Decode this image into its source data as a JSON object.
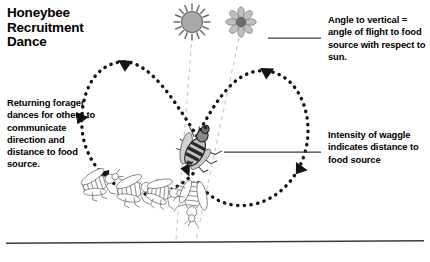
{
  "figure": {
    "title": "Honeybee\nRecruitment\nDance",
    "background_color": "#ffffff",
    "ink_color": "#000000",
    "rule_color": "#3c3c3c"
  },
  "captions": {
    "returning_forager": "Returning forager dances for others to communicate direction and distance to food source.",
    "angle_to_vertical": "Angle to vertical = angle of flight to food source with respect to sun.",
    "intensity_of_waggle": "Intensity of waggle indicates distance to food source"
  },
  "diagram": {
    "sun": {
      "name": "sun",
      "fill": "#a8a8a8",
      "stroke": "#6e6e6e",
      "cx": 192,
      "cy": 22,
      "r": 11
    },
    "flower": {
      "name": "flower",
      "petal_fill": "#bdbdbd",
      "center_fill": "#6b6b6b",
      "cx": 241,
      "cy": 22,
      "r": 12
    },
    "dance_path": {
      "name": "waggle-dance-figure-eight",
      "style": "dashed",
      "dash_color": "#141414",
      "arrow_count": 5,
      "description": "Figure-eight waggle dance loop traced by the returning forager"
    },
    "reference_lines": [
      {
        "name": "vertical-reference-from-sun",
        "color": "#c4c4c4",
        "style": "dashed"
      },
      {
        "name": "flight-angle-reference-from-flower",
        "color": "#c4c4c4",
        "style": "dashed"
      }
    ],
    "bees": {
      "dancer": {
        "name": "dancing-forager-bee",
        "body_fill": "#8e8e8e",
        "outline": "#2b2b2b"
      },
      "followers_count": 4,
      "followers_outline": "#7a7a7a"
    },
    "leader_lines": [
      {
        "name": "leader-line-angle",
        "x1": 268,
        "y1": 38,
        "x2": 321,
        "y2": 38
      },
      {
        "name": "leader-line-intensity",
        "x1": 224,
        "y1": 152,
        "x2": 320,
        "y2": 152
      }
    ],
    "bottom_rule": {
      "name": "bottom-rule",
      "x1": 6,
      "y1": 243,
      "x2": 424,
      "y2": 241
    }
  }
}
